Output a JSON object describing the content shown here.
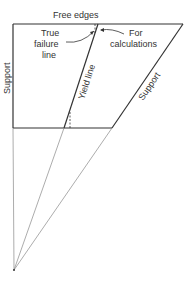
{
  "diagram": {
    "labels": {
      "free_edges": "Free edges",
      "true_failure_line_1": "True",
      "true_failure_line_2": "failure",
      "true_failure_line_3": "line",
      "for_calc_1": "For",
      "for_calc_2": "calculations",
      "yield_line": "Yield line",
      "support_left": "Support",
      "support_diagonal": "Support"
    },
    "colors": {
      "stroke_main": "#333333",
      "stroke_thin": "#888888"
    }
  }
}
